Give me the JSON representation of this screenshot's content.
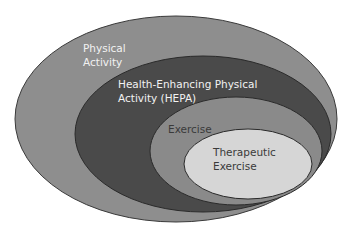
{
  "diagram": {
    "type": "nested-ellipses",
    "layers": [
      {
        "id": "physical-activity",
        "line1": "Physical",
        "line2": "Activity",
        "fill": "#8e8e8e"
      },
      {
        "id": "hepa",
        "line1": "Health-Enhancing Physical",
        "line2": "Activity (HEPA)",
        "fill": "#4a4a4a"
      },
      {
        "id": "exercise",
        "line1": "Exercise",
        "line2": "",
        "fill": "#8a8a8a"
      },
      {
        "id": "therapeutic-exercise",
        "line1": "Therapeutic",
        "line2": "Exercise",
        "fill": "#d6d6d6"
      }
    ],
    "stroke": "#2a2a2a"
  }
}
